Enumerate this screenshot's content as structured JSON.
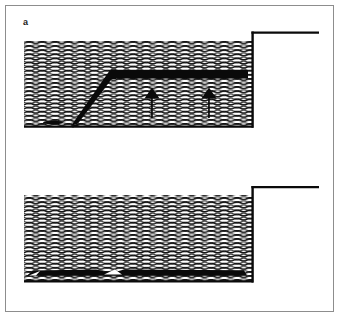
{
  "figure": {
    "title": "",
    "width": 339,
    "height": 317,
    "background": "#ffffff",
    "frame_color": "#8d8d8d",
    "ink_color": "#000000",
    "water_color": "#000000",
    "panel_count": 2
  },
  "panels": [
    {
      "id": "a",
      "label": "a",
      "description": "Water reservoir in cross-section with hatched wave fill; an inclined dark bar rises from the basin floor to a long horizontal dark bar suspended mid-depth; two upward arrows below the horizontal bar; a step-shaped solid wall closes the basin on the right and continues as a horizontal ground line.",
      "elements": [
        {
          "name": "water-body",
          "kind": "wave-hatch-region",
          "label": ""
        },
        {
          "name": "inclined-bar",
          "kind": "solid-bar",
          "label": ""
        },
        {
          "name": "horizontal-bar",
          "kind": "solid-bar",
          "label": ""
        },
        {
          "name": "up-arrow-left",
          "kind": "arrow",
          "direction": "up",
          "label": ""
        },
        {
          "name": "up-arrow-right",
          "kind": "arrow",
          "direction": "up",
          "label": ""
        },
        {
          "name": "floor-deposit",
          "kind": "solid-blob",
          "label": ""
        },
        {
          "name": "step-wall",
          "kind": "outline-step",
          "label": ""
        }
      ]
    },
    {
      "id": "b",
      "label": "b",
      "description": "Same reservoir cross-section with hatched wave fill; the dark material now lies flat along the basin floor as a thin settled layer broken by two pale gaps; the same step-shaped wall closes the basin on the right.",
      "elements": [
        {
          "name": "water-body",
          "kind": "wave-hatch-region",
          "label": ""
        },
        {
          "name": "settled-layer",
          "kind": "solid-bar",
          "label": ""
        },
        {
          "name": "gap-left",
          "kind": "void",
          "label": ""
        },
        {
          "name": "gap-right",
          "kind": "void",
          "label": ""
        },
        {
          "name": "step-wall",
          "kind": "outline-step",
          "label": ""
        }
      ]
    }
  ]
}
